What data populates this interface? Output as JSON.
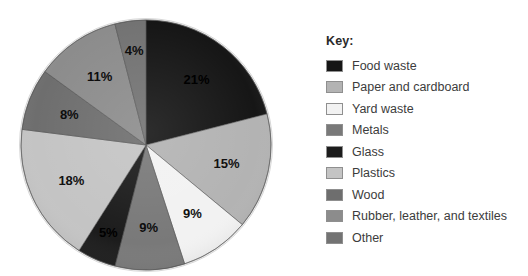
{
  "legend": {
    "title": "Key:",
    "position": "right"
  },
  "chart_data": {
    "type": "pie",
    "title": "",
    "subtitle": "",
    "xlabel": "",
    "ylabel": "",
    "grid": false,
    "legend_position": "right",
    "units": "percent",
    "total": 100,
    "start_angle_deg": 0,
    "direction": "clockwise",
    "center": {
      "x": 146,
      "y": 145
    },
    "radius": 125,
    "categories": [
      "Food waste",
      "Paper and cardboard",
      "Yard waste",
      "Metals",
      "Glass",
      "Plastics",
      "Wood",
      "Rubber, leather, and textiles",
      "Other"
    ],
    "values": [
      21,
      15,
      9,
      9,
      5,
      18,
      8,
      11,
      4
    ],
    "colors": [
      "#161616",
      "#b3b3b3",
      "#f2f2f2",
      "#797979",
      "#1c1c1c",
      "#c4c4c4",
      "#6e6e6e",
      "#8c8c8c",
      "#737373"
    ],
    "slices": [
      {
        "label": "Food waste",
        "value": 21,
        "display": "21%",
        "color": "#161616",
        "label_color": "#000000"
      },
      {
        "label": "Paper and cardboard",
        "value": 15,
        "display": "15%",
        "color": "#b3b3b3",
        "label_color": "#111111"
      },
      {
        "label": "Yard waste",
        "value": 9,
        "display": "9%",
        "color": "#f2f2f2",
        "label_color": "#111111"
      },
      {
        "label": "Metals",
        "value": 9,
        "display": "9%",
        "color": "#797979",
        "label_color": "#0d0d0d"
      },
      {
        "label": "Glass",
        "value": 5,
        "display": "5%",
        "color": "#1c1c1c",
        "label_color": "#000000"
      },
      {
        "label": "Plastics",
        "value": 18,
        "display": "18%",
        "color": "#c4c4c4",
        "label_color": "#111111"
      },
      {
        "label": "Wood",
        "value": 8,
        "display": "8%",
        "color": "#6e6e6e",
        "label_color": "#0d0d0d"
      },
      {
        "label": "Rubber, leather, and textiles",
        "value": 11,
        "display": "11%",
        "color": "#8c8c8c",
        "label_color": "#0d0d0d"
      },
      {
        "label": "Other",
        "value": 4,
        "display": "4%",
        "color": "#737373",
        "label_color": "#0d0d0d"
      }
    ]
  }
}
